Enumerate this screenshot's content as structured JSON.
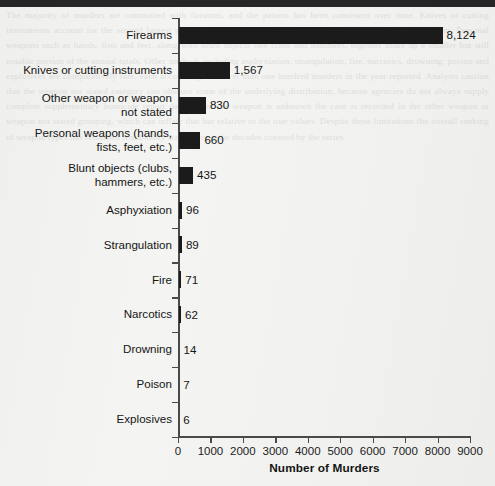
{
  "page": {
    "background_color": "#f1f1ef",
    "scan_edge_color": "#262626",
    "bleed_through_text": "The majority of murders are committed with firearms, and the pattern has been consistent over time. Knives or cutting instruments account for the second largest share of homicides reported to the Uniform Crime Reporting Program. Personal weapons such as hands, fists and feet, along with blunt objects like clubs and hammers, together make up a smaller but still notable portion of the annual totals. Other methods including asphyxiation, strangulation, fire, narcotics, drowning, poison and explosives are comparatively rare, each accounting for fewer than one hundred murders in the year reported. Analysts caution that the weapon not stated category can obscure some of the underlying distribution, because agencies do not always supply complete supplementary homicide report data. When the weapon is unknown the case is recorded in the other weapon or weapon not stated grouping, which can inflate that bar relative to the true values. Despite these limitations the overall ranking of weapon types has remained remarkably stable across the decades covered by the series."
  },
  "chart_data": {
    "type": "bar",
    "orientation": "horizontal",
    "title": "",
    "xlabel": "Number of Murders",
    "ylabel": "",
    "xlim": [
      0,
      9000
    ],
    "xticks": [
      0,
      1000,
      2000,
      3000,
      4000,
      5000,
      6000,
      7000,
      8000,
      9000
    ],
    "xticklabels": [
      "0",
      "1000",
      "2000",
      "3000",
      "4000",
      "5000",
      "6000",
      "7000",
      "8000",
      "9000"
    ],
    "grid": false,
    "legend": false,
    "bar_color": "#1b1b1b",
    "categories": [
      "Firearms",
      "Knives or cutting instruments",
      "Other weapon or weapon\nnot stated",
      "Personal weapons (hands,\nfists, feet, etc.)",
      "Blunt objects (clubs,\nhammers, etc.)",
      "Asphyxiation",
      "Strangulation",
      "Fire",
      "Narcotics",
      "Drowning",
      "Poison",
      "Explosives"
    ],
    "values": [
      8124,
      1567,
      830,
      660,
      435,
      96,
      89,
      71,
      62,
      14,
      7,
      6
    ],
    "value_labels": [
      "8,124",
      "1,567",
      "830",
      "660",
      "435",
      "96",
      "89",
      "71",
      "62",
      "14",
      "7",
      "6"
    ]
  }
}
